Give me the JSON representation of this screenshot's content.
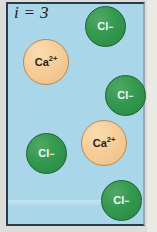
{
  "figure": {
    "index_label": "i = 3",
    "background_color": "#a9d6e9",
    "border_color": "#2b3a44",
    "outer_color": "#dcdcd8"
  },
  "legend": {
    "chloride_color": "#2f8f46",
    "calcium_color": "#f5cb96"
  },
  "particles": [
    {
      "id": "cl-1",
      "species": "chloride",
      "symbol": "Cl",
      "charge": "−",
      "x": 77,
      "y": 2,
      "size": 41
    },
    {
      "id": "ca-1",
      "species": "calcium",
      "symbol": "Ca",
      "charge": "2+",
      "x": 15,
      "y": 35,
      "size": 46
    },
    {
      "id": "cl-2",
      "species": "chloride",
      "symbol": "Cl",
      "charge": "−",
      "x": 97,
      "y": 71,
      "size": 41
    },
    {
      "id": "ca-2",
      "species": "calcium",
      "symbol": "Ca",
      "charge": "2+",
      "x": 73,
      "y": 116,
      "size": 46
    },
    {
      "id": "cl-3",
      "species": "chloride",
      "symbol": "Cl",
      "charge": "−",
      "x": 18,
      "y": 129,
      "size": 41
    },
    {
      "id": "cl-4",
      "species": "chloride",
      "symbol": "Cl",
      "charge": "−",
      "x": 93,
      "y": 176,
      "size": 41
    }
  ]
}
